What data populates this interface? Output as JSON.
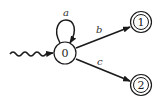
{
  "diagram": {
    "type": "finite-automaton",
    "colors": {
      "stroke": "#1a1a1a",
      "background": "#ffffff"
    },
    "states": [
      {
        "id": "0",
        "label": "0",
        "initial": true,
        "accepting": false
      },
      {
        "id": "1",
        "label": "1",
        "initial": false,
        "accepting": true
      },
      {
        "id": "2",
        "label": "2",
        "initial": false,
        "accepting": true
      }
    ],
    "transitions": [
      {
        "from": "0",
        "to": "0",
        "label": "a"
      },
      {
        "from": "0",
        "to": "1",
        "label": "b"
      },
      {
        "from": "0",
        "to": "2",
        "label": "c"
      }
    ]
  }
}
